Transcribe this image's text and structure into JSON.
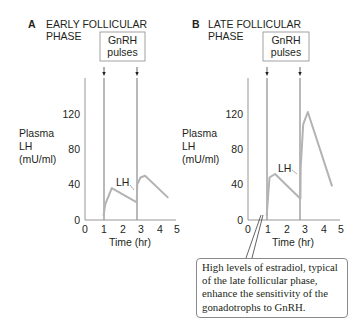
{
  "chart_data": [
    {
      "type": "line",
      "panel": "A",
      "title": "EARLY FOLLICULAR PHASE",
      "annotation_box": "GnRH pulses",
      "pulse_times_hr": [
        1.0,
        2.8
      ],
      "xlabel": "Time (hr)",
      "ylabel": "Plasma LH (mU/ml)",
      "x_ticks": [
        0,
        1,
        2,
        3,
        4,
        5
      ],
      "y_ticks": [
        0,
        40,
        80,
        120
      ],
      "xlim": [
        0,
        5
      ],
      "ylim": [
        0,
        150
      ],
      "series": [
        {
          "name": "LH",
          "x": [
            1.0,
            1.1,
            1.45,
            2.8,
            2.82,
            3.0,
            3.25,
            4.5
          ],
          "y": [
            5,
            18,
            36,
            20,
            40,
            48,
            50,
            25
          ]
        }
      ]
    },
    {
      "type": "line",
      "panel": "B",
      "title": "LATE FOLLICULAR PHASE",
      "annotation_box": "GnRH pulses",
      "pulse_times_hr": [
        1.0,
        2.8
      ],
      "xlabel": "Time (hr)",
      "ylabel": "Plasma LH (mU/ml)",
      "x_ticks": [
        0,
        1,
        2,
        3,
        4,
        5
      ],
      "y_ticks": [
        0,
        40,
        80,
        120
      ],
      "xlim": [
        0,
        5
      ],
      "ylim": [
        0,
        150
      ],
      "series": [
        {
          "name": "LH",
          "x": [
            1.0,
            1.15,
            1.45,
            2.8,
            2.82,
            2.95,
            3.2,
            4.5
          ],
          "y": [
            5,
            48,
            52,
            24,
            60,
            108,
            122,
            38
          ]
        }
      ],
      "callout": "High levels of estradiol, typical of the late follicular phase, enhance the sensitivity of the gonadotrophs to GnRH."
    }
  ],
  "panels": {
    "a": {
      "letter": "A",
      "title_line1": "EARLY FOLLICULAR",
      "title_line2": "PHASE",
      "box_line1": "GnRH",
      "box_line2": "pulses",
      "ylabel_line1": "Plasma",
      "ylabel_line2": "LH",
      "ylabel_line3": "(mU/ml)",
      "series_label": "LH",
      "xlabel": "Time (hr)",
      "y_ticks": [
        "0",
        "40",
        "80",
        "120"
      ],
      "x_ticks": [
        "0",
        "1",
        "2",
        "3",
        "4",
        "5"
      ]
    },
    "b": {
      "letter": "B",
      "title_line1": "LATE FOLLICULAR",
      "title_line2": "PHASE",
      "box_line1": "GnRH",
      "box_line2": "pulses",
      "ylabel_line1": "Plasma",
      "ylabel_line2": "LH",
      "ylabel_line3": "(mU/ml)",
      "series_label": "LH",
      "xlabel": "Time (hr)",
      "y_ticks": [
        "0",
        "40",
        "80",
        "120"
      ],
      "x_ticks": [
        "0",
        "1",
        "2",
        "3",
        "4",
        "5"
      ]
    }
  },
  "callout": {
    "text": "High levels of estradiol, typical of the late follicular phase, enhance the sensitivity of the gonadotrophs to GnRH."
  },
  "colors": {
    "curve": "#b3b3b3",
    "axis": "#8a8a8a",
    "pulse_line": "#8a8a8a",
    "text": "#231f20"
  }
}
